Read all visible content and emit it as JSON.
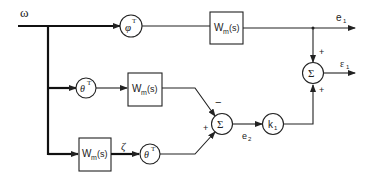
{
  "diagram": {
    "type": "block-diagram",
    "input": {
      "label": "ω"
    },
    "blocks": [
      {
        "id": "phiT",
        "shape": "circle",
        "label": "φ",
        "sup": "T"
      },
      {
        "id": "wm_top",
        "shape": "box",
        "label": "W",
        "sub": "m",
        "arg": "(s)"
      },
      {
        "id": "thetaT_mid",
        "shape": "circle",
        "label": "θ",
        "sup": "T"
      },
      {
        "id": "wm_mid",
        "shape": "box",
        "label": "W",
        "sub": "m",
        "arg": "(s)"
      },
      {
        "id": "wm_bot",
        "shape": "box",
        "label": "W",
        "sub": "m",
        "arg": "(s)"
      },
      {
        "id": "thetaT_bot",
        "shape": "circle",
        "label": "θ",
        "sup": "T"
      },
      {
        "id": "sum_mid",
        "shape": "circle",
        "label": "Σ"
      },
      {
        "id": "k1",
        "shape": "circle",
        "label": "k",
        "sub": "1"
      },
      {
        "id": "sum_out",
        "shape": "circle",
        "label": "Σ"
      }
    ],
    "signals": {
      "zeta": "ζ",
      "e1": {
        "label": "e",
        "sub": "1"
      },
      "e2": {
        "label": "e",
        "sub": "2"
      },
      "eps1": {
        "label": "ε",
        "sub": "1"
      }
    },
    "signs": {
      "sum_mid_top": "−",
      "sum_mid_bottom": "+",
      "sum_out_top": "+",
      "sum_out_bottom": "+"
    }
  }
}
